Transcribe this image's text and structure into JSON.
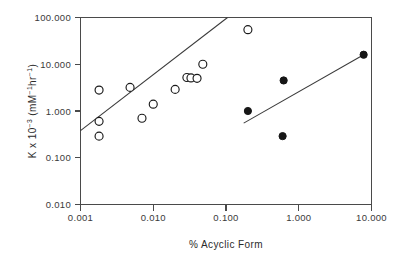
{
  "chart_data": {
    "type": "scatter",
    "title": "",
    "xlabel": "% Acyclic Form",
    "ylabel": "K x 10-3 (mM-1hr-1)",
    "xscale": "log",
    "yscale": "log",
    "xlim": [
      0.001,
      10.0
    ],
    "ylim": [
      0.01,
      100.0
    ],
    "grid": false,
    "legend": "none",
    "xticks": [
      "0.001",
      "0.010",
      "0.100",
      "1.000",
      "10.000"
    ],
    "xtick_values": [
      0.001,
      0.01,
      0.1,
      1.0,
      10.0
    ],
    "yticks": [
      "100.000",
      "10.000",
      "1.000",
      "0.100",
      "0.010"
    ],
    "ytick_values": [
      100.0,
      10.0,
      1.0,
      0.1,
      0.01
    ],
    "series": [
      {
        "name": "open-circles",
        "marker": "open-circle",
        "color": "#1a1a1a",
        "points": [
          {
            "x": 0.0018,
            "y": 2.8
          },
          {
            "x": 0.0018,
            "y": 0.6
          },
          {
            "x": 0.0018,
            "y": 0.29
          },
          {
            "x": 0.0048,
            "y": 3.2
          },
          {
            "x": 0.007,
            "y": 0.7
          },
          {
            "x": 0.01,
            "y": 1.4
          },
          {
            "x": 0.02,
            "y": 2.9
          },
          {
            "x": 0.029,
            "y": 5.2
          },
          {
            "x": 0.033,
            "y": 5.1
          },
          {
            "x": 0.04,
            "y": 5.0
          },
          {
            "x": 0.048,
            "y": 10.0
          },
          {
            "x": 0.2,
            "y": 55.0
          }
        ]
      },
      {
        "name": "filled-circles",
        "marker": "filled-circle",
        "color": "#161616",
        "points": [
          {
            "x": 0.2,
            "y": 1.0
          },
          {
            "x": 0.62,
            "y": 4.5
          },
          {
            "x": 0.6,
            "y": 0.29
          },
          {
            "x": 7.8,
            "y": 16.0
          }
        ]
      }
    ],
    "fit_lines": [
      {
        "name": "upper-regression-line",
        "x0": 0.001,
        "y0": 0.38,
        "x1": 0.105,
        "y1": 100.0
      },
      {
        "name": "lower-regression-line",
        "x0": 0.175,
        "y0": 0.55,
        "x1": 7.8,
        "y1": 16.0
      }
    ]
  },
  "axis_title_parts": {
    "y_k": "K x 10",
    "y_exp1": "−3",
    "y_open": " (mM",
    "y_exp2": "−1",
    "y_hr": "hr",
    "y_exp3": "−1",
    "y_close": ")",
    "x_title": "% Acyclic Form"
  }
}
